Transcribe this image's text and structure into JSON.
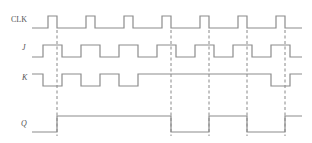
{
  "diagram": {
    "type": "timing-diagram",
    "colors": {
      "wave": "#8c8c8c",
      "guide": "#7a7a7a",
      "label": "#555555",
      "background": "#ffffff"
    },
    "signals": [
      {
        "name": "CLK",
        "label_pos": [
          11,
          22
        ],
        "italic": false,
        "y_high": 16,
        "y_low": 28,
        "x_start": 32,
        "x_end": 302,
        "initial": 0,
        "edges": [
          48,
          57,
          86,
          95,
          124,
          133,
          162,
          171,
          200,
          209,
          238,
          247,
          276,
          285
        ]
      },
      {
        "name": "J",
        "label_pos": [
          22,
          50
        ],
        "italic": true,
        "y_high": 45,
        "y_low": 57,
        "x_start": 32,
        "x_end": 302,
        "initial": 0,
        "edges": [
          43,
          62,
          81,
          100,
          119,
          138,
          157,
          176,
          195,
          214,
          233,
          252,
          271,
          290
        ]
      },
      {
        "name": "K",
        "label_pos": [
          22,
          80
        ],
        "italic": true,
        "y_high": 74,
        "y_low": 86,
        "x_start": 32,
        "x_end": 302,
        "initial": 1,
        "edges": [
          43,
          62,
          81,
          100,
          119,
          138,
          271,
          290
        ]
      },
      {
        "name": "Q",
        "label_pos": [
          21,
          126
        ],
        "italic": true,
        "y_high": 116,
        "y_low": 132,
        "x_start": 32,
        "x_end": 302,
        "initial": 0,
        "edges": [
          57,
          171,
          209,
          247,
          285
        ]
      }
    ],
    "guides": {
      "x": [
        57,
        171,
        209,
        247,
        285
      ],
      "y_top": 30,
      "y_bottom": 136
    }
  }
}
